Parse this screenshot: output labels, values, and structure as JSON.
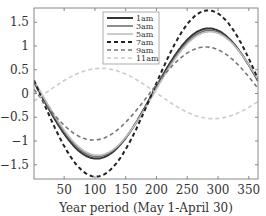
{
  "chart_data": {
    "type": "line",
    "title": "",
    "xlabel": "Year period (May 1-April 30)",
    "ylabel": "",
    "xlim": [
      1,
      365
    ],
    "ylim": [
      -1.8,
      1.8
    ],
    "xticks": [
      50,
      100,
      150,
      200,
      250,
      300,
      350
    ],
    "yticks": [
      -1.5,
      -1,
      -0.5,
      0,
      0.5,
      1,
      1.5
    ],
    "ytick_labels": [
      "−1.5",
      "−1",
      "−0.5",
      "0",
      "0.5",
      "1",
      "1.5"
    ],
    "grid": false,
    "legend_position": "upper center",
    "series": [
      {
        "name": "1am",
        "amplitude": 1.37,
        "peak_day": 285,
        "color": "#333333",
        "style": "solid",
        "width": 2.0
      },
      {
        "name": "3am",
        "amplitude": 1.33,
        "peak_day": 286,
        "color": "#707070",
        "style": "solid",
        "width": 1.6
      },
      {
        "name": "5am",
        "amplitude": 1.3,
        "peak_day": 287,
        "color": "#bdbdbd",
        "style": "solid",
        "width": 1.6
      },
      {
        "name": "7am",
        "amplitude": 1.75,
        "peak_day": 284,
        "color": "#222222",
        "style": "dashed",
        "width": 2.0
      },
      {
        "name": "9am",
        "amplitude": 0.98,
        "peak_day": 280,
        "color": "#777777",
        "style": "dashed",
        "width": 1.6
      },
      {
        "name": "11am",
        "amplitude": 0.53,
        "peak_day": 110,
        "color": "#cccccc",
        "style": "dashed",
        "width": 1.6
      }
    ]
  }
}
